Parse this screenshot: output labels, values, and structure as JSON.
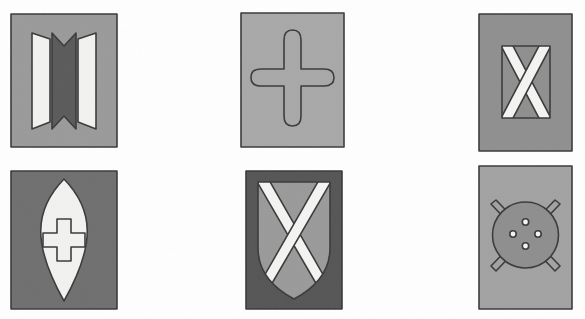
{
  "figure": {
    "background_color": "#ffffff",
    "panel_count": 6,
    "rows": 2,
    "columns": 3,
    "palette": {
      "mid_gray": "#9a9a9a",
      "light_gray": "#b0b0b0",
      "dark_gray": "#5a5a5a",
      "charcoal": "#4a4a4a",
      "near_white": "#f2f2f0",
      "outline": "#3a3a3a",
      "paper_white": "#ffffff"
    },
    "panels": [
      {
        "id": "panel-1",
        "position": "top-left",
        "caption": "bowtie-chevron-device",
        "motif": "hourglass-bowtie",
        "field_color": "#9a9a9a",
        "charge_color": "#5a5a5a",
        "accent_color": "#f2f2f0",
        "border_color": "#3a3a3a",
        "x": 10,
        "y": 13,
        "w": 108,
        "h": 135
      },
      {
        "id": "panel-2",
        "position": "top-center",
        "caption": "rounded-cross-device",
        "motif": "cross-pattee-rounded",
        "field_color": "#a8a8a8",
        "charge_color": "#a8a8a8",
        "accent_color": "#a8a8a8",
        "border_color": "#3a3a3a",
        "x": 240,
        "y": 12,
        "w": 105,
        "h": 136
      },
      {
        "id": "panel-3",
        "position": "top-right",
        "caption": "saltire-panel-device",
        "motif": "saltire-in-rectangle",
        "field_color": "#8f8f8f",
        "charge_color": "#8f8f8f",
        "accent_color": "#f4f4f2",
        "border_color": "#3a3a3a",
        "x": 478,
        "y": 13,
        "w": 95,
        "h": 139
      },
      {
        "id": "panel-4",
        "position": "bottom-left",
        "caption": "vesica-cross-device",
        "motif": "vesica-piscis-with-greek-cross",
        "field_color": "#6f6f6f",
        "charge_color": "#f2f2f0",
        "accent_color": "#f2f2f0",
        "border_color": "#3a3a3a",
        "x": 10,
        "y": 170,
        "w": 108,
        "h": 140
      },
      {
        "id": "panel-5",
        "position": "bottom-center",
        "caption": "shield-saltire-device",
        "motif": "shield-with-saltire",
        "field_color": "#555555",
        "charge_color": "#9a9a9a",
        "accent_color": "#f4f4f2",
        "border_color": "#3a3a3a",
        "x": 245,
        "y": 170,
        "w": 98,
        "h": 140
      },
      {
        "id": "panel-6",
        "position": "bottom-right",
        "caption": "button-and-pins-device",
        "motif": "disc-with-four-holes-and-crossed-pins",
        "field_color": "#a2a2a2",
        "charge_color": "#8e8e8e",
        "accent_color": "#f4f4f2",
        "border_color": "#3a3a3a",
        "x": 478,
        "y": 165,
        "w": 95,
        "h": 145,
        "hole_count": 4
      }
    ]
  }
}
